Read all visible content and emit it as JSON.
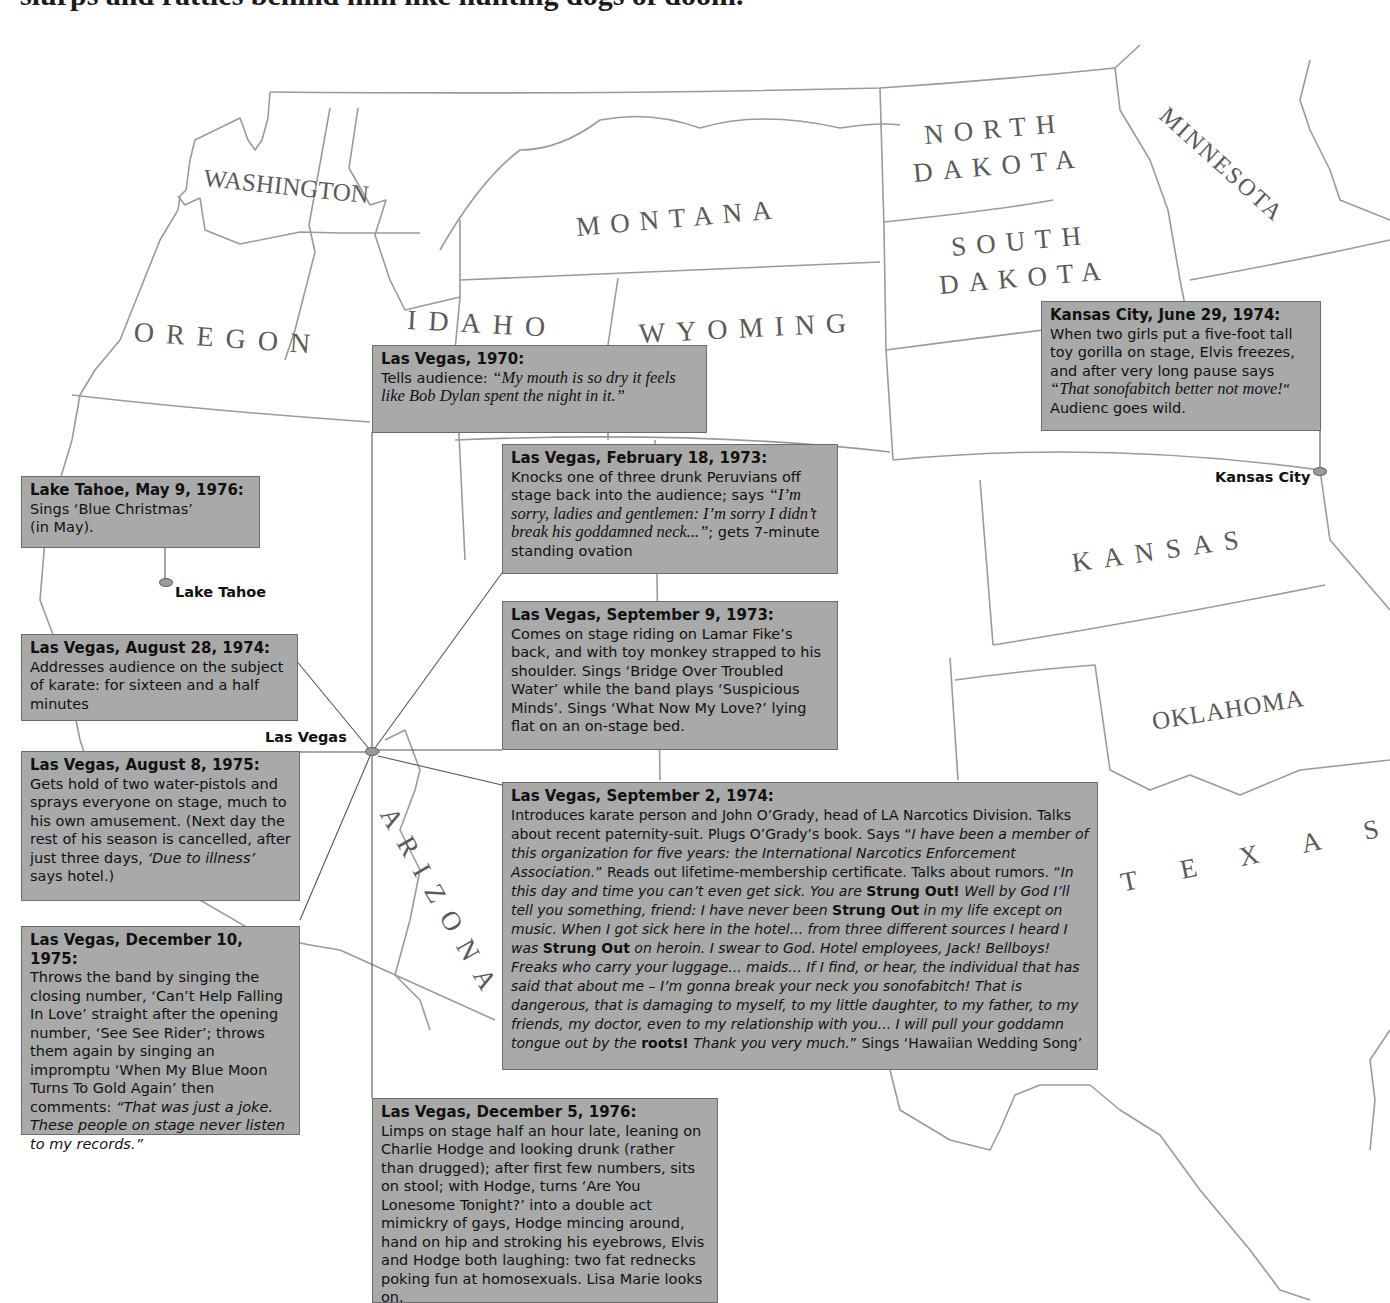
{
  "header": {
    "text": "slurps and rattles behind him like hunting dogs of doom."
  },
  "states": [
    {
      "id": "washington",
      "label": "WASHINGTON"
    },
    {
      "id": "oregon",
      "label": "OREGON"
    },
    {
      "id": "idaho",
      "label": "IDAHO"
    },
    {
      "id": "montana",
      "label": "MONTANA"
    },
    {
      "id": "wyoming",
      "label": "WYOMING"
    },
    {
      "id": "north_dakota_1",
      "label": "NORTH"
    },
    {
      "id": "north_dakota_2",
      "label": "DAKOTA"
    },
    {
      "id": "south_dakota_1",
      "label": "SOUTH"
    },
    {
      "id": "south_dakota_2",
      "label": "DAKOTA"
    },
    {
      "id": "minnesota",
      "label": "MINNESOTA"
    },
    {
      "id": "kansas",
      "label": "KANSAS"
    },
    {
      "id": "oklahoma",
      "label": "OKLAHOMA"
    },
    {
      "id": "texas",
      "label": "TEXAS"
    },
    {
      "id": "arizona",
      "label": "ARIZONA"
    }
  ],
  "cities": {
    "las_vegas": "Las Vegas",
    "lake_tahoe": "Lake Tahoe",
    "kansas_city": "Kansas City"
  },
  "events": {
    "lv_1970": {
      "title": "Las Vegas, 1970:",
      "pre": "Tells audience: ",
      "quote": "“My mouth is so dry it feels like Bob Dylan spent the night in it.”"
    },
    "kc_1974": {
      "title": "Kansas City, June 29, 1974:",
      "pre": "When two girls put a five-foot tall toy gorilla on stage, Elvis freezes, and after very long pause says ",
      "quote": "“That sonofabitch better not move!",
      "post": "“ Audienc goes wild."
    },
    "lt_1976": {
      "title": "Lake Tahoe, May 9, 1976:",
      "line1": "Sings ‘Blue Christmas’",
      "line2": "(in May)."
    },
    "lv_feb_1973": {
      "title": "Las Vegas, February 18, 1973:",
      "pre": "Knocks one of three drunk Peruvians off stage back into the audience; says ",
      "quote": "“I’m sorry, ladies and gentlemen: I’m sorry I didn’t break his goddamned neck...”",
      "post": "; gets 7-minute standing ovation"
    },
    "lv_sep9_1973": {
      "title": "Las Vegas, September 9, 1973:",
      "body": "Comes on stage riding on Lamar Fike’s back, and with toy monkey strapped to his shoulder. Sings ‘Bridge Over Troubled Water’ while the band plays ‘Suspicious Minds’. Sings ‘What Now My Love?’ lying flat on an on-stage bed."
    },
    "lv_aug28_1974": {
      "title": "Las Vegas, August 28, 1974:",
      "body": "Addresses audience on the subject of karate: for sixteen and a half minutes"
    },
    "lv_aug8_1975": {
      "title": "Las Vegas, August 8, 1975:",
      "pre": "Gets hold of two water-pistols and sprays everyone on stage, much to his own amusement. (Next day the rest of his season is cancelled, after just three days, ",
      "quote": "‘Due to illness’",
      "post": " says hotel.)"
    },
    "lv_dec10_1975": {
      "title": "Las Vegas, December 10, 1975:",
      "pre": "Throws the band by singing the closing number, ‘Can’t Help Falling In Love’ straight after the opening number, ‘See See Rider’; throws them again by singing an impromptu ‘When My Blue Moon Turns To Gold Again’ then comments: ",
      "quote": "“That was just a joke. These people on stage never listen to my records.”"
    },
    "lv_sep2_1974": {
      "title": "Las Vegas, September 2, 1974:",
      "p1": "Introduces karate person and John O’Grady, head of LA Narcotics Division. Talks about recent paternity-suit. Plugs O’Grady’s book. Says “",
      "q1": "I have been a member of this organization for five years: the International Narcotics Enforcement Association.",
      "p2": "” Reads out lifetime-membership certificate. Talks about rumors. “",
      "q2": "In this day and time you can’t even get sick. You are ",
      "b1": "Strung Out!",
      "q3": " Well by God I’ll tell you something, friend: I have never been ",
      "b2": "Strung Out",
      "q4": " in my life except on music. When I got sick here in the hotel... from three different sources I heard I was ",
      "b3": "Strung Out",
      "q5": " on heroin. I swear to God. Hotel employees, Jack! Bellboys! Freaks who carry your luggage... maids... If I find, or hear, the individual that has said that about me – I’m gonna break your neck you sonofabitch! That is dangerous, that is damaging to myself, to my little daughter, to my father, to my friends, my doctor, even to my relationship with you... I will pull your goddamn tongue out by the ",
      "b4": "roots!",
      "q6": " Thank you very much.",
      "p3": "” Sings ‘Hawaiian Wedding Song’"
    },
    "lv_dec5_1976": {
      "title": "Las Vegas, December 5, 1976:",
      "body": "Limps on stage half an hour late, leaning on Charlie Hodge and looking drunk (rather than drugged); after first few numbers, sits on stool; with Hodge, turns ‘Are You Lonesome Tonight?’ into a double act mimickry of gays, Hodge mincing around, hand on hip and stroking his eyebrows, Elvis and Hodge both laughing: two fat rednecks poking fun at homosexuals. Lisa Marie looks on."
    }
  },
  "colors": {
    "box_fill": "#a9a9a9",
    "box_border": "#6c6c6c",
    "state_border": "#9a9a9a",
    "label": "#5a5a5a"
  }
}
